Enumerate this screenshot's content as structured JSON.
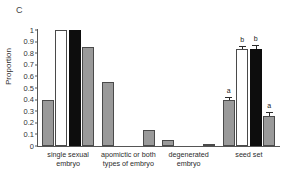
{
  "panel": {
    "label": "C"
  },
  "chart_data": {
    "type": "bar",
    "title": "",
    "xlabel": "",
    "ylabel": "Proportion",
    "ylim": [
      0,
      1
    ],
    "yticks": [
      "0",
      "0.1",
      "0.2",
      "0.3",
      "0.4",
      "0.5",
      "0.6",
      "0.7",
      "0.8",
      "0.9",
      "1"
    ],
    "grid": false,
    "legend": "none",
    "categories": [
      "single sexual embryo",
      "apomictic or both types of embryo",
      "degenerated embryo",
      "seed set"
    ],
    "category_lines": [
      [
        "single sexual",
        "embryo"
      ],
      [
        "apomictic or both",
        "types of embryo"
      ],
      [
        "degenerated",
        "embryo"
      ],
      [
        "seed set"
      ]
    ],
    "series": [
      {
        "name": "series-1",
        "fill": "gray",
        "values": [
          0.4,
          0.55,
          0.055,
          0.4
        ]
      },
      {
        "name": "series-2",
        "fill": "white",
        "values": [
          1.0,
          0.0,
          0.0,
          0.84
        ]
      },
      {
        "name": "series-3",
        "fill": "black",
        "values": [
          1.0,
          0.0,
          0.0,
          0.84
        ]
      },
      {
        "name": "series-4",
        "fill": "gray",
        "values": [
          0.85,
          0.14,
          0.02,
          0.26
        ]
      }
    ],
    "errors": [
      {
        "group": 3,
        "series": 0,
        "value": 0.4,
        "err": 0.025,
        "letter": "a"
      },
      {
        "group": 3,
        "series": 1,
        "value": 0.84,
        "err": 0.025,
        "letter": "b"
      },
      {
        "group": 3,
        "series": 2,
        "value": 0.84,
        "err": 0.035,
        "letter": "b"
      },
      {
        "group": 3,
        "series": 3,
        "value": 0.26,
        "err": 0.03,
        "letter": "a"
      }
    ],
    "colors": {
      "gray": "#9a9a9a",
      "white": "#ffffff",
      "black": "#0d0d0d",
      "outline": "#4a4a4a",
      "axis": "#555555"
    }
  }
}
